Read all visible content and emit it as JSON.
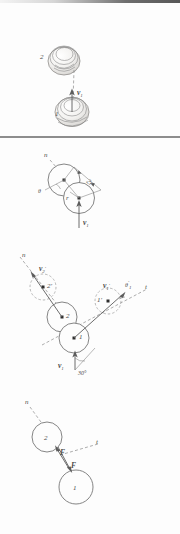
{
  "figure": {
    "panel_count": 4,
    "background_color": "#fdfdfd",
    "ink_color": "#5c5c5c"
  },
  "panels": [
    {
      "id": "panel-1",
      "name": "before-impact-pictorial",
      "caption": "",
      "ball_labels": {
        "ball_one": "1",
        "ball_two": "2"
      },
      "vectors": [
        {
          "name": "v1",
          "symbol": "v",
          "subscript": "1",
          "prime": false,
          "direction": "up"
        }
      ]
    },
    {
      "id": "panel-2",
      "name": "impact-geometry",
      "caption": "",
      "ball_labels": {
        "ball_one": "",
        "ball_two": ""
      },
      "axis_labels": {
        "normal": "n"
      },
      "dimension_label": "2r",
      "radius_label": "r",
      "angle_label": "θ",
      "vectors": [
        {
          "name": "v1",
          "symbol": "v",
          "subscript": "1",
          "prime": false,
          "direction": "up"
        }
      ]
    },
    {
      "id": "panel-3",
      "name": "after-impact-velocities",
      "caption": "",
      "ball_labels": {
        "ball_one": "1",
        "ball_two": "2",
        "ball_one_prime": "1'",
        "ball_two_prime": "2'"
      },
      "axis_labels": {
        "normal": "n",
        "tangent": "t"
      },
      "angle_labels": {
        "incoming": "30°",
        "outgoing_one": "θ"
      },
      "vectors": [
        {
          "name": "v1",
          "symbol": "v",
          "subscript": "1",
          "prime": false,
          "direction": "up"
        },
        {
          "name": "v1-prime",
          "symbol": "v",
          "subscript": "1",
          "prime": true,
          "direction": "up-right"
        },
        {
          "name": "v2-prime",
          "symbol": "v",
          "subscript": "2",
          "prime": true,
          "direction": "up-left"
        }
      ],
      "prime_marks": {
        "theta_prime_sub": "1"
      }
    },
    {
      "id": "panel-4",
      "name": "impulse-force-pair",
      "caption": "",
      "ball_labels": {
        "ball_one": "1",
        "ball_two": "2"
      },
      "axis_labels": {
        "normal": "n",
        "tangent": "t"
      },
      "force_labels": {
        "on_two": "F",
        "on_one": "F"
      }
    }
  ],
  "glyphs": {
    "prime": "′",
    "degree": "°",
    "theta": "θ"
  }
}
